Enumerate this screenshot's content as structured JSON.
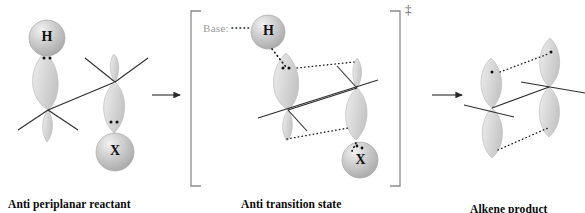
{
  "figure": {
    "background": "#ffffff",
    "panels": [
      {
        "id": "reactant",
        "caption": "Anti periplanar reactant",
        "atoms": [
          {
            "label": "H",
            "type": "sphere"
          },
          {
            "label": "X",
            "type": "sphere"
          }
        ],
        "lone_pairs": 2
      },
      {
        "id": "transition-state",
        "caption": "Anti transition state",
        "bracket": true,
        "dagger": "‡",
        "base_label": "Base",
        "base_colon": ":",
        "atoms": [
          {
            "label": "H",
            "type": "sphere"
          },
          {
            "label": "X",
            "type": "sphere"
          }
        ]
      },
      {
        "id": "product",
        "caption": "Alkene product",
        "atoms": []
      }
    ],
    "arrows": [
      {
        "name": "arrow-reactant-to-ts"
      },
      {
        "name": "arrow-ts-to-product"
      }
    ],
    "colors": {
      "orbital_fill": "#d9d9d9",
      "orbital_stroke": "#b8b8b8",
      "sphere_fill": "#c9c9c9",
      "bond_stroke": "#2b2b2b",
      "dotted_stroke": "#1a1a1a",
      "bracket_stroke": "#8a8a8a",
      "base_text": "#9a9a9a",
      "caption_text": "#0a0a0a"
    }
  }
}
